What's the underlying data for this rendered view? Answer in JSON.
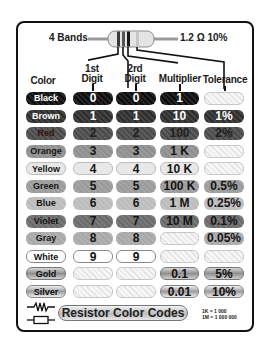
{
  "header": {
    "bands_label": "4 Bands",
    "example_value": "1.2 Ω 10%",
    "example_bands": [
      "#5a3a28",
      "#b03030",
      "#1a1a1a",
      "#c0c0c0"
    ]
  },
  "columns": {
    "color": "Color",
    "digit1_line1": "1st",
    "digit1_line2": "Digit",
    "digit2_line1": "2rd",
    "digit2_line2": "Digit",
    "multiplier": "Multiplier",
    "tolerance": "Tolerance"
  },
  "rows": [
    {
      "color": "Black",
      "d1": "0",
      "d2": "0",
      "mult": "1",
      "tol": ""
    },
    {
      "color": "Brown",
      "d1": "1",
      "d2": "1",
      "mult": "10",
      "tol": "1%"
    },
    {
      "color": "Red",
      "d1": "2",
      "d2": "2",
      "mult": "100",
      "tol": "2%"
    },
    {
      "color": "Orange",
      "d1": "3",
      "d2": "3",
      "mult": "1 K",
      "tol": ""
    },
    {
      "color": "Yellow",
      "d1": "4",
      "d2": "4",
      "mult": "10 K",
      "tol": ""
    },
    {
      "color": "Green",
      "d1": "5",
      "d2": "5",
      "mult": "100 K",
      "tol": "0.5%"
    },
    {
      "color": "Blue",
      "d1": "6",
      "d2": "6",
      "mult": "1 M",
      "tol": "0.25%"
    },
    {
      "color": "Violet",
      "d1": "7",
      "d2": "7",
      "mult": "10 M",
      "tol": "0.1%"
    },
    {
      "color": "Gray",
      "d1": "8",
      "d2": "8",
      "mult": "",
      "tol": "0.05%"
    },
    {
      "color": "White",
      "d1": "9",
      "d2": "9",
      "mult": "",
      "tol": ""
    },
    {
      "color": "Gold",
      "d1": "",
      "d2": "",
      "mult": "0.1",
      "tol": "5%"
    },
    {
      "color": "Silver",
      "d1": "",
      "d2": "",
      "mult": "0.01",
      "tol": "10%"
    }
  ],
  "footer": {
    "title": "Resistor Color Codes",
    "note_line1": "1K = 1 000",
    "note_line2": "1M = 1 000 000",
    "symbols": [
      "zigzag-resistor-symbol",
      "box-resistor-symbol"
    ]
  }
}
